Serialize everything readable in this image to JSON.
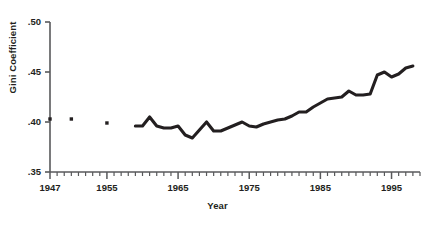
{
  "chart_data": {
    "type": "line",
    "title": "",
    "xlabel": "Year",
    "ylabel": "Gini Coefficient",
    "xlim": [
      1947,
      1999
    ],
    "ylim": [
      0.35,
      0.5
    ],
    "grid": false,
    "legend": "none",
    "y_ticks": [
      0.35,
      0.4,
      0.45,
      0.5
    ],
    "y_tick_labels": [
      ".35",
      ".40",
      ".45",
      ".50"
    ],
    "x_ticks": [
      1947,
      1955,
      1965,
      1975,
      1985,
      1995
    ],
    "x_tick_labels": [
      "1947",
      "1955",
      "1965",
      "1975",
      "1985",
      "1995"
    ],
    "x_minor_tick_interval": 1,
    "series": [
      {
        "name": "Gini Coefficient (isolated points)",
        "style": "markers",
        "marker": "square",
        "color": "#231f20",
        "x": [
          1947,
          1950,
          1955
        ],
        "values": [
          0.403,
          0.403,
          0.399
        ]
      },
      {
        "name": "Gini Coefficient (annual series)",
        "style": "line",
        "color": "#231f20",
        "x": [
          1959,
          1960,
          1961,
          1962,
          1963,
          1964,
          1965,
          1966,
          1967,
          1968,
          1969,
          1970,
          1971,
          1972,
          1973,
          1974,
          1975,
          1976,
          1977,
          1978,
          1979,
          1980,
          1981,
          1982,
          1983,
          1984,
          1985,
          1986,
          1987,
          1988,
          1989,
          1990,
          1991,
          1992,
          1993,
          1994,
          1995,
          1996,
          1997,
          1998
        ],
        "values": [
          0.396,
          0.396,
          0.405,
          0.396,
          0.394,
          0.394,
          0.396,
          0.387,
          0.384,
          0.392,
          0.4,
          0.391,
          0.391,
          0.394,
          0.397,
          0.4,
          0.396,
          0.395,
          0.398,
          0.4,
          0.402,
          0.403,
          0.406,
          0.41,
          0.41,
          0.415,
          0.419,
          0.423,
          0.424,
          0.425,
          0.431,
          0.427,
          0.427,
          0.428,
          0.447,
          0.45,
          0.445,
          0.448,
          0.454,
          0.456
        ]
      }
    ]
  }
}
